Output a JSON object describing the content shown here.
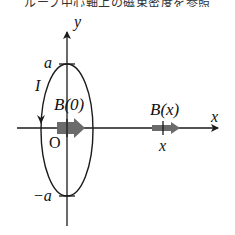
{
  "caption": {
    "text": "ループ中心軸上の磁束密度を参照",
    "note": "partially cropped at top edge"
  },
  "diagram": {
    "axes": {
      "x_label": "x",
      "y_label": "y",
      "origin_label": "O"
    },
    "loop": {
      "top_label": "a",
      "bottom_label": "−a",
      "current_label": "I"
    },
    "fields": [
      {
        "label": "B(0)",
        "position": "origin"
      },
      {
        "label": "B(x)",
        "position": "x",
        "tick_label": "x"
      }
    ],
    "colors": {
      "line": "#1a1a1a",
      "field_arrow": "#6b6b6b",
      "background": "#ffffff"
    }
  }
}
